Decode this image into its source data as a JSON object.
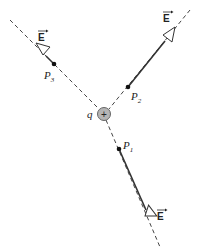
{
  "diagram": {
    "type": "electric-field-lines-point-charge",
    "charge": {
      "label": "q",
      "sign": "+",
      "fill": "#b0b0b0"
    },
    "points": [
      {
        "id": "P1",
        "label": "P",
        "subscript": "1"
      },
      {
        "id": "P2",
        "label": "P",
        "subscript": "2"
      },
      {
        "id": "P3",
        "label": "P",
        "subscript": "3"
      }
    ],
    "field_label": "E",
    "vector_arrow": "→"
  }
}
